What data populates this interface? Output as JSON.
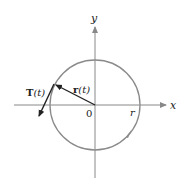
{
  "diagram": {
    "axes": {
      "x_label": "x",
      "y_label": "y",
      "origin_label": "0"
    },
    "circle": {
      "radius_label": "r",
      "direction": "counterclockwise"
    },
    "vectors": {
      "position": {
        "label_bold": "r",
        "label_arg": "(t)"
      },
      "tangent": {
        "label_bold": "T",
        "label_arg": "(t)"
      }
    },
    "colors": {
      "circle": "#8a8a8a",
      "axes": "#7a7a7a",
      "vectors": "#222222"
    }
  }
}
